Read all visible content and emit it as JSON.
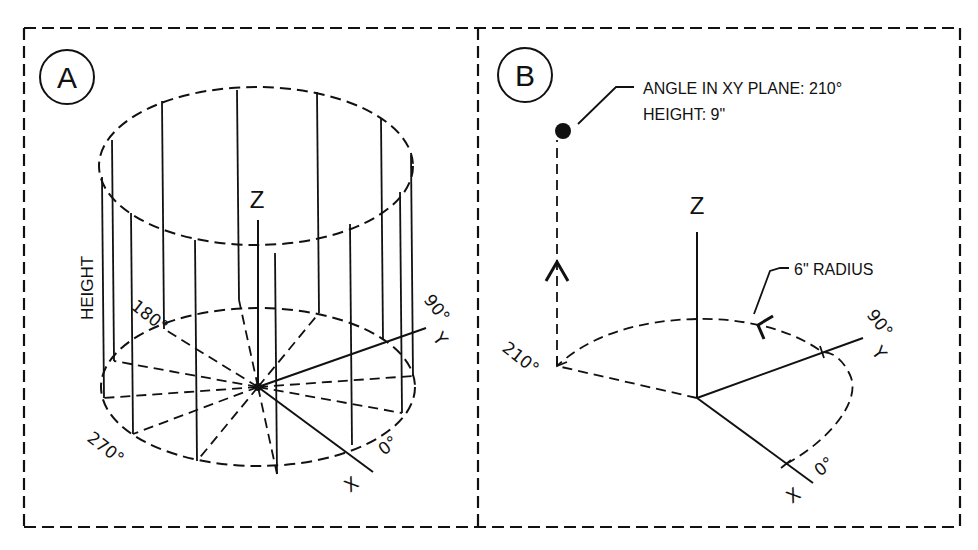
{
  "figure": {
    "panels": [
      {
        "id": "A",
        "label": "A",
        "axis_labels": {
          "z": "Z",
          "y": "Y",
          "x": "X"
        },
        "side_label": "HEIGHT",
        "angle_labels": [
          "180°",
          "90°",
          "270°",
          "0°"
        ],
        "description": "Cylindrical coordinate system shown as a cylinder divided into 30° segments"
      },
      {
        "id": "B",
        "label": "B",
        "axis_labels": {
          "z": "Z",
          "y": "Y",
          "x": "X"
        },
        "callout": {
          "line1": "ANGLE IN XY PLANE: 210°",
          "line2": "HEIGHT: 9\""
        },
        "radius_label": "6\" RADIUS",
        "angle_labels": [
          "90°",
          "210°",
          "0°"
        ],
        "point": {
          "angle_deg": 210,
          "height_in": 9,
          "radius_in": 6
        }
      }
    ]
  },
  "colors": {
    "ink": "#111111",
    "background": "#ffffff"
  }
}
